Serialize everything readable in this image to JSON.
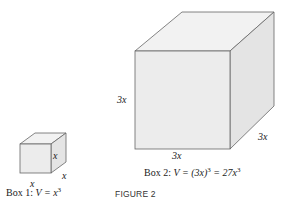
{
  "figure": {
    "title": "FIGURE 2",
    "box1": {
      "caption_prefix": "Box 1:",
      "caption_formula": "V = x",
      "caption_exp": "3",
      "labels": {
        "height": "x",
        "width": "x",
        "depth": "x"
      }
    },
    "box2": {
      "caption_prefix": "Box 2:",
      "caption_formula_a": "V = (3x)",
      "caption_exp_a": "3",
      "caption_formula_b": " = 27x",
      "caption_exp_b": "3",
      "labels": {
        "height": "3x",
        "width": "3x",
        "depth": "3x"
      }
    },
    "colors": {
      "front": "#ececec",
      "top": "#f2f2f2",
      "side": "#e4e4e4",
      "stroke": "#555555"
    }
  }
}
